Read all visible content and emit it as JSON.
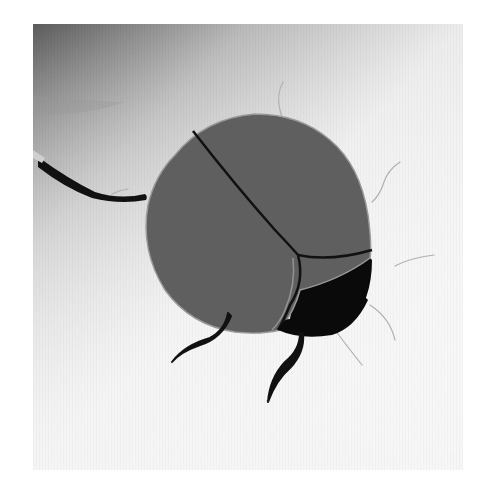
{
  "image": {
    "subject": "Stylized illustration of a dark gray beetle on a gray-to-white gradient background",
    "alt": "Beetle illustration",
    "colors": {
      "background_dark": "#6a6a6a",
      "background_light": "#f7f7f7",
      "shell": "#5e5e5e",
      "shell_edge": "#8a8a8a",
      "head": "#0a0a0a",
      "legs": "#111111",
      "antennae": "#b8b8b8"
    }
  }
}
